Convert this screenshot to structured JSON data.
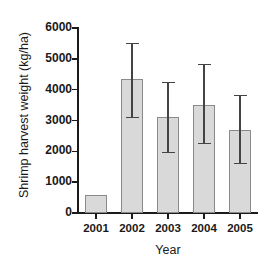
{
  "chart_data": {
    "type": "bar",
    "title": "",
    "xlabel": "Year",
    "ylabel": "Shrimp harvest weight (kg/ha)",
    "categories": [
      "2001",
      "2002",
      "2003",
      "2004",
      "2005"
    ],
    "values": [
      600,
      4330,
      3120,
      3500,
      2700
    ],
    "errors_upper": [
      600,
      5520,
      4250,
      4840,
      3830
    ],
    "errors_lower": [
      600,
      3120,
      1980,
      2270,
      1620
    ],
    "has_error_bars": [
      false,
      true,
      true,
      true,
      true
    ],
    "ylim": [
      0,
      6000
    ],
    "yticks": [
      0,
      1000,
      2000,
      3000,
      4000,
      5000,
      6000
    ],
    "ytick_labels": [
      "0",
      "1000",
      "2000",
      "3000",
      "4000",
      "5000",
      "6000"
    ],
    "grid": false,
    "legend": null,
    "bar_fill_color": "#d9d9d9",
    "bar_edge_color": "#8a8a8a",
    "axis_color": "#1a1a1a",
    "error_bar_color": "#444444"
  }
}
